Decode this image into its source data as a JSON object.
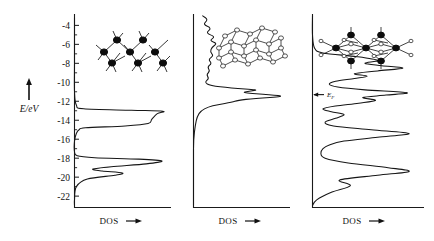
{
  "figure": {
    "kind": "density-of-states-panels",
    "y_axis": {
      "label": "E/eV",
      "arrow": "up-arrow",
      "tick_labels": [
        "-4",
        "-6",
        "-8",
        "-10",
        "-12",
        "-14",
        "-16",
        "-18",
        "-20",
        "-22"
      ],
      "tick_values": [
        -4,
        -6,
        -8,
        -10,
        -12,
        -14,
        -16,
        -18,
        -20,
        -22
      ],
      "range": [
        -23.2,
        -2.8
      ],
      "minor_tick_step": 1
    },
    "panels": [
      {
        "id": "panel-1",
        "x_label": "DOS",
        "x_arrow": "right-arrow",
        "structure_caption": "zigzag-chain-lattice",
        "fermi_label": null
      },
      {
        "id": "panel-2",
        "x_label": "DOS",
        "x_arrow": "right-arrow",
        "structure_caption": "layered-sheet-lattice",
        "fermi_label": null
      },
      {
        "id": "panel-3",
        "x_label": "DOS",
        "x_arrow": "right-arrow",
        "structure_caption": "three-dimensional-framework-lattice",
        "fermi_label": "E",
        "fermi_sub": "F",
        "fermi_energy": -11.3
      }
    ]
  },
  "chart_data": {
    "type": "line",
    "title": "",
    "xlabel": "DOS",
    "ylabel": "E/eV",
    "ylim": [
      -23.2,
      -2.8
    ],
    "xlim": [
      0,
      1
    ],
    "grid": false,
    "legend": "none",
    "orientation": "horizontal-density-vertical-energy",
    "yticks": [
      -4,
      -6,
      -8,
      -10,
      -12,
      -14,
      -16,
      -18,
      -20,
      -22
    ],
    "annotations": [
      {
        "panel": 3,
        "text": "E_F",
        "energy": -11.3,
        "marker": "left-arrow"
      }
    ],
    "series": [
      {
        "name": "panel-1-DOS",
        "panel": 1,
        "energy": [
          -3.2,
          -8.0,
          -11.0,
          -12.4,
          -12.8,
          -12.95,
          -13.05,
          -13.3,
          -13.9,
          -14.35,
          -14.6,
          -14.8,
          -15.0,
          -15.4,
          -16.2,
          -17.3,
          -17.75,
          -17.95,
          -18.1,
          -18.3,
          -18.6,
          -18.9,
          -19.15,
          -19.35,
          -19.55,
          -19.8,
          -20.2,
          -21.0,
          -22.4,
          -23.0
        ],
        "dos": [
          0.0,
          0.0,
          0.0,
          0.02,
          0.1,
          0.62,
          0.96,
          0.9,
          0.84,
          0.8,
          0.55,
          0.12,
          0.05,
          0.02,
          0.0,
          0.0,
          0.03,
          0.22,
          0.7,
          0.95,
          0.78,
          0.4,
          0.2,
          0.3,
          0.52,
          0.44,
          0.14,
          0.02,
          0.0,
          0.0
        ]
      },
      {
        "name": "panel-2-DOS",
        "panel": 2,
        "energy": [
          -3.0,
          -3.4,
          -3.9,
          -4.3,
          -4.8,
          -5.2,
          -5.6,
          -5.9,
          -6.3,
          -6.8,
          -7.2,
          -7.6,
          -8.0,
          -8.4,
          -8.8,
          -9.2,
          -9.6,
          -10.0,
          -10.35,
          -10.6,
          -10.8,
          -10.95,
          -11.1,
          -11.3,
          -11.5,
          -11.7,
          -11.9,
          -12.1,
          -12.35,
          -12.6,
          -13.0,
          -13.6,
          -14.5,
          -16.0,
          -18.0,
          -20.0,
          -22.0,
          -23.0
        ],
        "dos": [
          0.1,
          0.16,
          0.1,
          0.2,
          0.13,
          0.24,
          0.17,
          0.26,
          0.2,
          0.18,
          0.22,
          0.16,
          0.2,
          0.15,
          0.18,
          0.14,
          0.17,
          0.12,
          0.18,
          0.4,
          0.72,
          0.6,
          0.52,
          0.84,
          1.0,
          0.66,
          0.48,
          0.42,
          0.26,
          0.16,
          0.08,
          0.04,
          0.02,
          0.0,
          0.0,
          0.0,
          0.0,
          0.0
        ]
      },
      {
        "name": "panel-3-DOS",
        "panel": 3,
        "energy": [
          -3.0,
          -5.0,
          -6.4,
          -6.9,
          -7.3,
          -7.7,
          -8.0,
          -8.25,
          -8.5,
          -8.8,
          -9.1,
          -9.35,
          -9.6,
          -9.9,
          -10.2,
          -10.5,
          -10.8,
          -11.1,
          -11.35,
          -11.6,
          -11.9,
          -12.2,
          -12.5,
          -12.8,
          -13.1,
          -13.4,
          -13.8,
          -14.2,
          -14.6,
          -15.0,
          -15.4,
          -15.8,
          -16.2,
          -16.6,
          -17.0,
          -17.5,
          -18.0,
          -18.5,
          -19.0,
          -19.4,
          -19.8,
          -20.3,
          -20.9,
          -21.6,
          -22.4,
          -23.0
        ],
        "dos": [
          0.0,
          0.0,
          0.02,
          0.1,
          0.42,
          0.62,
          0.5,
          0.66,
          0.86,
          0.62,
          0.4,
          0.52,
          0.4,
          0.22,
          0.16,
          0.24,
          0.5,
          0.9,
          0.7,
          0.48,
          0.6,
          0.44,
          0.22,
          0.1,
          0.18,
          0.3,
          0.22,
          0.12,
          0.2,
          0.56,
          0.92,
          0.62,
          0.3,
          0.16,
          0.1,
          0.08,
          0.12,
          0.34,
          0.72,
          0.92,
          0.62,
          0.26,
          0.36,
          0.18,
          0.04,
          0.0
        ]
      }
    ]
  }
}
